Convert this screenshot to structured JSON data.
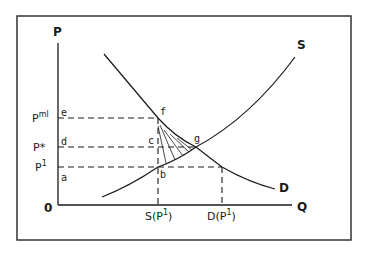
{
  "diagram": {
    "type": "supply-demand",
    "axes": {
      "y_label": "P",
      "x_label": "Q",
      "origin_label": "0"
    },
    "curves": {
      "supply_label": "S",
      "demand_label": "D"
    },
    "price_levels": [
      {
        "id": "pml",
        "label": "P",
        "sup": "ml",
        "point": "e"
      },
      {
        "id": "pstar",
        "label": "P*",
        "sup": "",
        "point": "d"
      },
      {
        "id": "p1",
        "label": "P",
        "sup": "1",
        "point": "a"
      }
    ],
    "quantity_levels": [
      {
        "id": "sp1",
        "label": "S(P",
        "sup": "1",
        "close": ")"
      },
      {
        "id": "dp1",
        "label": "D(P",
        "sup": "1",
        "close": ")"
      }
    ],
    "points": {
      "f": "f",
      "c": "c",
      "g": "g",
      "b": "b"
    },
    "colors": {
      "ink": "#1a1a1a",
      "background": "#ffffff"
    }
  }
}
